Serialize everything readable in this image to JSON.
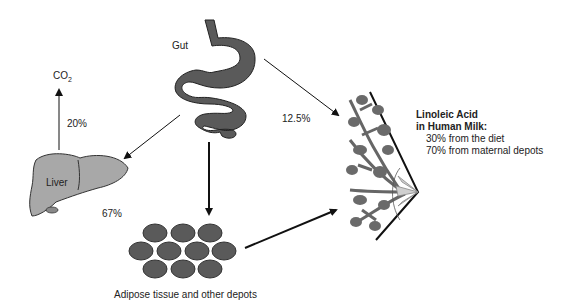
{
  "labels": {
    "gut": "Gut",
    "co2_main": "CO",
    "co2_sub": "2",
    "pct_oxidation": "20%",
    "pct_milk_direct": "12.5%",
    "liver": "Liver",
    "pct_liver": "67%",
    "adipose": "Adipose tissue and other depots"
  },
  "milk_box": {
    "title_line1": "Linoleic Acid",
    "title_line2": "in Human Milk:",
    "line1": "30% from the diet",
    "line2": "70% from maternal depots"
  },
  "colors": {
    "organ_dark": "#5a5a5a",
    "organ_light": "#a8a8a8",
    "arrow": "#111111"
  }
}
